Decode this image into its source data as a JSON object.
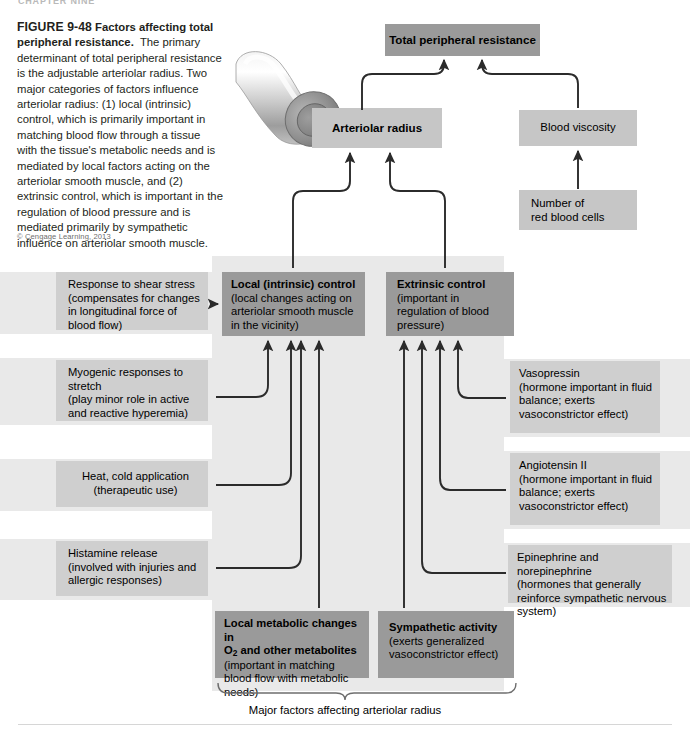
{
  "running_header": "CHAPTER NINE",
  "caption": {
    "figure_number": "FIGURE 9-48",
    "title": "Factors affecting total peripheral resistance.",
    "body": "The primary determinant of total peripheral resistance is the adjustable arteriolar radius. Two major categories of factors influence arteriolar radius: (1) local (intrinsic) control, which is primarily important in matching blood flow through a tissue with the tissue's metabolic needs and is mediated by local factors acting on the arteriolar smooth muscle, and (2) extrinsic control, which is important in the regulation of blood pressure and is mediated primarily by sympathetic influence on arteriolar smooth muscle.",
    "copyright": "© Cengage Learning, 2013"
  },
  "colors": {
    "box_dark": "#9a9a9a",
    "box_mid": "#c6c6c6",
    "box_light": "#cfcfcf",
    "panel_bg": "#e9e9e9",
    "arrow": "#2b2b2b",
    "page_bg": "#ffffff"
  },
  "illustration": {
    "name": "arteriole-cross-section"
  },
  "top": {
    "total_peripheral_resistance": "Total peripheral resistance",
    "arteriolar_radius": "Arteriolar radius",
    "blood_viscosity": "Blood viscosity",
    "red_blood_cells_line1": "Number of",
    "red_blood_cells_line2": "red blood cells"
  },
  "control": {
    "local": {
      "heading": "Local (intrinsic) control",
      "detail": "(local changes acting on arteriolar smooth muscle in the vicinity)"
    },
    "extrinsic": {
      "heading": "Extrinsic control",
      "detail": "(important in regulation of blood pressure)"
    }
  },
  "left_factors": [
    {
      "heading": "Response to shear stress",
      "detail": "(compensates for changes in longitudinal force of blood flow)"
    },
    {
      "heading": "Myogenic responses to stretch",
      "detail": "(play minor role in active and reactive hyperemia)"
    },
    {
      "heading": "Heat, cold application",
      "detail": "(therapeutic use)"
    },
    {
      "heading": "Histamine release",
      "detail": "(involved with injuries and allergic responses)"
    }
  ],
  "right_factors": [
    {
      "heading": "Vasopressin",
      "detail": "(hormone important in fluid balance; exerts vasoconstrictor effect)"
    },
    {
      "heading": "Angiotensin II",
      "detail": "(hormone important in fluid balance; exerts vasoconstrictor effect)"
    },
    {
      "heading": "Epinephrine and norepinephrine",
      "detail": "(hormones that generally reinforce sympathetic nervous system)"
    }
  ],
  "bottom": {
    "metabolic": {
      "heading_line1": "Local metabolic changes in",
      "heading_line2_pre": "O",
      "heading_line2_sub": "2",
      "heading_line2_post": " and other metabolites",
      "detail": "(important in matching blood flow with metabolic needs)"
    },
    "sympathetic": {
      "heading": "Sympathetic activity",
      "detail": "(exerts generalized vasoconstrictor effect)"
    },
    "brace_label": "Major factors affecting arteriolar radius"
  }
}
